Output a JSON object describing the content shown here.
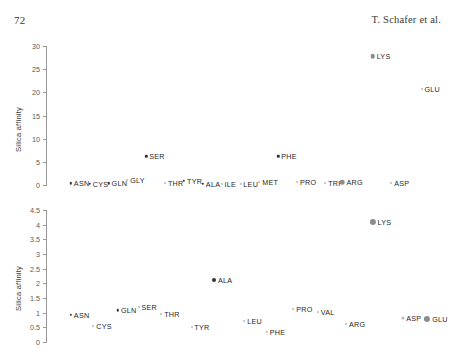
{
  "page": {
    "folio": "72",
    "running_head": "T. Schafer et al."
  },
  "colors": {
    "marker_dark": "#333333",
    "marker_gray": "#8c8c8c",
    "marker_light": "#b8b8b8",
    "axis": "#9a9a9a",
    "text": "#1f1f1f"
  },
  "chart_data": [
    {
      "id": "top",
      "type": "scatter",
      "title": "",
      "xlabel": "",
      "ylabel": "Silica affinity",
      "xlim": [
        0,
        21
      ],
      "ylim": [
        0,
        30
      ],
      "yticks": [
        0,
        5,
        10,
        15,
        20,
        25,
        30
      ],
      "ytick_labels": [
        "0",
        "5",
        "10",
        "15",
        "20",
        "25",
        "30"
      ],
      "xticks_shown": false,
      "grid": false,
      "legend": "none",
      "points": [
        {
          "label": "ASN",
          "x": 1,
          "y": 0.4,
          "marker": "small-dark"
        },
        {
          "label": "CYS",
          "x": 2,
          "y": 0.3,
          "marker": "small-dark"
        },
        {
          "label": "GLN",
          "x": 3,
          "y": 0.4,
          "marker": "small-dark"
        },
        {
          "label": "GLY",
          "x": 4,
          "y": 1.1,
          "marker": "small-light"
        },
        {
          "label": "SER",
          "x": 5,
          "y": 6.2,
          "marker": "small-dark"
        },
        {
          "label": "THR",
          "x": 6,
          "y": 0.4,
          "marker": "small-light"
        },
        {
          "label": "TYR",
          "x": 7,
          "y": 0.9,
          "marker": "small-dark"
        },
        {
          "label": "ALA",
          "x": 8,
          "y": 0.3,
          "marker": "small-dark"
        },
        {
          "label": "ILE",
          "x": 9,
          "y": 0.3,
          "marker": "small-light"
        },
        {
          "label": "LEU",
          "x": 10,
          "y": 0.3,
          "marker": "small-light"
        },
        {
          "label": "MET",
          "x": 11,
          "y": 0.6,
          "marker": "small-light"
        },
        {
          "label": "PRO",
          "x": 13,
          "y": 0.6,
          "marker": "small-light"
        },
        {
          "label": "TRP",
          "x": 14.5,
          "y": 0.4,
          "marker": "small-light"
        },
        {
          "label": "ARG",
          "x": 15.4,
          "y": 0.6,
          "marker": "medium-gray"
        },
        {
          "label": "LYS",
          "x": 17,
          "y": 27.8,
          "marker": "medium-gray"
        },
        {
          "label": "ASP",
          "x": 18,
          "y": 0.5,
          "marker": "small-light"
        },
        {
          "label": "GLU",
          "x": 19.6,
          "y": 20.8,
          "marker": "small-light"
        },
        {
          "label": "PHE",
          "x": 12,
          "y": 6.2,
          "marker": "small-dark"
        }
      ]
    },
    {
      "id": "bottom",
      "type": "scatter",
      "title": "",
      "xlabel": "",
      "ylabel": "Silica affinity",
      "xlim": [
        0,
        21
      ],
      "ylim": [
        0,
        4.5
      ],
      "yticks": [
        0,
        0.5,
        1,
        1.5,
        2,
        2.5,
        3,
        3.5,
        4,
        4.5
      ],
      "ytick_labels": [
        "0",
        "0.5",
        "1",
        "1.5",
        "2",
        "2.5",
        "3",
        "3.5",
        "4",
        "4.5"
      ],
      "xticks_shown": false,
      "grid": false,
      "legend": "none",
      "points": [
        {
          "label": "ASN",
          "x": 1,
          "y": 0.92,
          "marker": "small-dark"
        },
        {
          "label": "CYS",
          "x": 2.2,
          "y": 0.55,
          "marker": "small-light"
        },
        {
          "label": "GLN",
          "x": 3.5,
          "y": 1.08,
          "marker": "small-dark"
        },
        {
          "label": "SER",
          "x": 4.6,
          "y": 1.18,
          "marker": "small-light"
        },
        {
          "label": "THR",
          "x": 5.8,
          "y": 0.95,
          "marker": "small-light"
        },
        {
          "label": "TYR",
          "x": 7.4,
          "y": 0.52,
          "marker": "small-light"
        },
        {
          "label": "ALA",
          "x": 8.6,
          "y": 2.12,
          "marker": "medium-dark"
        },
        {
          "label": "LEU",
          "x": 10.2,
          "y": 0.72,
          "marker": "small-light"
        },
        {
          "label": "PHE",
          "x": 11.4,
          "y": 0.33,
          "marker": "small-light"
        },
        {
          "label": "PRO",
          "x": 12.8,
          "y": 1.12,
          "marker": "small-light"
        },
        {
          "label": "VAL",
          "x": 14.1,
          "y": 1.02,
          "marker": "small-light"
        },
        {
          "label": "ARG",
          "x": 15.6,
          "y": 0.62,
          "marker": "small-light"
        },
        {
          "label": "LYS",
          "x": 17,
          "y": 4.1,
          "marker": "large-gray"
        },
        {
          "label": "ASP",
          "x": 18.6,
          "y": 0.82,
          "marker": "medium-light"
        },
        {
          "label": "GLU",
          "x": 19.9,
          "y": 0.8,
          "marker": "large-gray"
        }
      ]
    }
  ]
}
